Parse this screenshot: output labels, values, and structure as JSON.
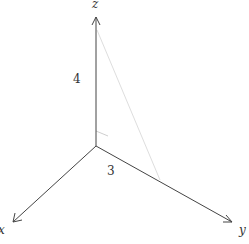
{
  "diagram": {
    "type": "3d-axes",
    "axes": [
      {
        "name": "x",
        "label": "x"
      },
      {
        "name": "y",
        "label": "y"
      },
      {
        "name": "z",
        "label": "z"
      }
    ],
    "annotations": [
      {
        "label": "4",
        "along": "z"
      },
      {
        "label": "3",
        "along": "y"
      }
    ],
    "colors": {
      "axis": "#444444",
      "faint_line": "#dddddd",
      "right_angle": "#cccccc",
      "text": "#333333"
    }
  }
}
